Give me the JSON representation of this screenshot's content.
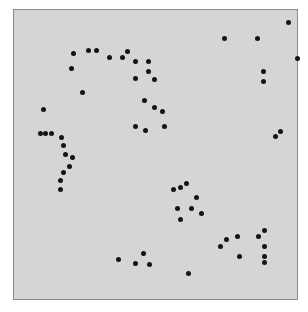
{
  "figure": {
    "title": "",
    "subtitle": "",
    "background_color": "#ffffff"
  },
  "plot": {
    "frame_fill_color": "#d5d5d5",
    "frame_border_color": "#8a8a8a",
    "marker_color": "#141414",
    "marker_size_px": 5,
    "grid": "off",
    "legend": "none",
    "x_axis_labels": [],
    "y_axis_labels": []
  },
  "chart_data": {
    "type": "scatter",
    "title": "",
    "xlabel": "",
    "ylabel": "",
    "xlim": [
      0,
      285
    ],
    "ylim": [
      0,
      291
    ],
    "grid": false,
    "legend_position": "none",
    "marker": "filled-circle",
    "marker_color": "#141414",
    "background_color": "#d5d5d5",
    "series": [
      {
        "name": "points",
        "points": [
          [
            276,
            13
          ],
          [
            212,
            29
          ],
          [
            245,
            29
          ],
          [
            285,
            49
          ],
          [
            60,
            44
          ],
          [
            75,
            41
          ],
          [
            83,
            41
          ],
          [
            96,
            48
          ],
          [
            109,
            48
          ],
          [
            114,
            42
          ],
          [
            122,
            52
          ],
          [
            135,
            52
          ],
          [
            58,
            59
          ],
          [
            251,
            62
          ],
          [
            251,
            72
          ],
          [
            122,
            69
          ],
          [
            135,
            62
          ],
          [
            141,
            70
          ],
          [
            69,
            83
          ],
          [
            131,
            91
          ],
          [
            141,
            98
          ],
          [
            150,
            102
          ],
          [
            30,
            100
          ],
          [
            122,
            117
          ],
          [
            132,
            121
          ],
          [
            152,
            117
          ],
          [
            27,
            124
          ],
          [
            32,
            124
          ],
          [
            38,
            124
          ],
          [
            263,
            127
          ],
          [
            268,
            122
          ],
          [
            48,
            128
          ],
          [
            50,
            136
          ],
          [
            52,
            145
          ],
          [
            59,
            149
          ],
          [
            56,
            158
          ],
          [
            50,
            164
          ],
          [
            47,
            172
          ],
          [
            47,
            181
          ],
          [
            161,
            181
          ],
          [
            168,
            179
          ],
          [
            174,
            175
          ],
          [
            184,
            189
          ],
          [
            165,
            200
          ],
          [
            179,
            200
          ],
          [
            189,
            205
          ],
          [
            168,
            211
          ],
          [
            225,
            228
          ],
          [
            246,
            228
          ],
          [
            252,
            222
          ],
          [
            252,
            238
          ],
          [
            208,
            238
          ],
          [
            214,
            231
          ],
          [
            227,
            248
          ],
          [
            252,
            248
          ],
          [
            252,
            254
          ],
          [
            105,
            251
          ],
          [
            130,
            245
          ],
          [
            122,
            255
          ],
          [
            136,
            256
          ],
          [
            176,
            265
          ]
        ]
      }
    ]
  }
}
